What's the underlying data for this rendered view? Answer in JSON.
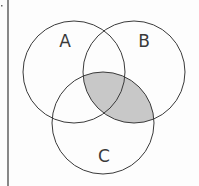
{
  "diagram": {
    "type": "venn",
    "sets": [
      {
        "label": "A",
        "cx": 74,
        "cy": 72,
        "r": 51,
        "label_x": 65,
        "label_y": 47
      },
      {
        "label": "B",
        "cx": 134,
        "cy": 72,
        "r": 51,
        "label_x": 144,
        "label_y": 47
      },
      {
        "label": "C",
        "cx": 103,
        "cy": 123,
        "r": 51,
        "label_x": 104,
        "label_y": 162
      }
    ],
    "shaded_region": "B ∩ C",
    "colors": {
      "stroke": "#3a3a3a",
      "shade": "#c8c8c8",
      "background": "#fdfdfd"
    }
  }
}
